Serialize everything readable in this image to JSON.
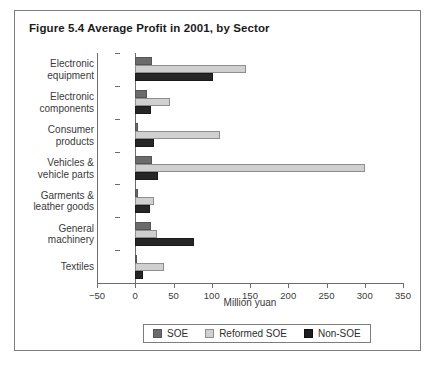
{
  "figure": {
    "title": "Figure 5.4  Average Profit in 2001, by Sector"
  },
  "chart_data": {
    "type": "bar",
    "orientation": "horizontal",
    "title": "Figure 5.4  Average Profit in 2001, by Sector",
    "xlabel": "Million yuan",
    "ylabel": "",
    "xlim": [
      -50,
      350
    ],
    "xticks": [
      -50,
      0,
      50,
      100,
      150,
      200,
      250,
      300,
      350
    ],
    "xtick_labels": [
      "−50",
      "0",
      "50",
      "100",
      "150",
      "200",
      "250",
      "300",
      "350"
    ],
    "grid": false,
    "legend_position": "bottom-center",
    "categories": [
      "Electronic equipment",
      "Electronic components",
      "Consumer products",
      "Vehicles & vehicle parts",
      "Garments & leather goods",
      "General machinery",
      "Textiles"
    ],
    "category_labels": [
      "Electronic\nequipment",
      "Electronic\ncomponents",
      "Consumer\nproducts",
      "Vehicles &\nvehicle parts",
      "Garments &\nleather goods",
      "General\nmachinery",
      "Textiles"
    ],
    "series": [
      {
        "name": "SOE",
        "color": "#6b6b6b",
        "values": [
          22,
          16,
          3,
          22,
          3,
          21,
          2
        ]
      },
      {
        "name": "Reformed SOE",
        "color": "#d0d0d0",
        "values": [
          145,
          45,
          111,
          300,
          25,
          28,
          38
        ]
      },
      {
        "name": "Non-SOE",
        "color": "#262626",
        "values": [
          101,
          21,
          25,
          30,
          19,
          77,
          10
        ]
      }
    ]
  },
  "legend": {
    "entries": [
      {
        "label": "SOE",
        "color": "#6b6b6b"
      },
      {
        "label": "Reformed SOE",
        "color": "#d0d0d0"
      },
      {
        "label": "Non-SOE",
        "color": "#1d1d1d"
      }
    ]
  }
}
